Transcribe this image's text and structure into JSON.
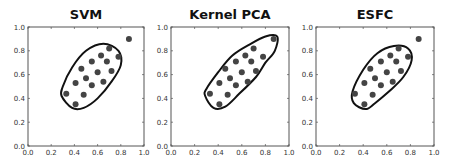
{
  "chart_data": [
    {
      "type": "scatter",
      "title": "SVM",
      "xlabel": "",
      "ylabel": "",
      "xlim": [
        0.0,
        1.0
      ],
      "ylim": [
        0.0,
        1.0
      ],
      "xticks": [
        "0.0",
        "0.2",
        "0.4",
        "0.6",
        "0.8",
        "1.0"
      ],
      "yticks": [
        "0.0",
        "0.2",
        "0.4",
        "0.6",
        "0.8",
        "1.0"
      ],
      "grid": false,
      "points": [
        [
          0.33,
          0.44
        ],
        [
          0.41,
          0.35
        ],
        [
          0.41,
          0.53
        ],
        [
          0.46,
          0.65
        ],
        [
          0.48,
          0.43
        ],
        [
          0.5,
          0.57
        ],
        [
          0.55,
          0.71
        ],
        [
          0.55,
          0.51
        ],
        [
          0.6,
          0.62
        ],
        [
          0.63,
          0.76
        ],
        [
          0.65,
          0.54
        ],
        [
          0.68,
          0.71
        ],
        [
          0.7,
          0.82
        ],
        [
          0.72,
          0.63
        ],
        [
          0.78,
          0.75
        ],
        [
          0.87,
          0.9
        ]
      ],
      "boundary": "closed contour enclosing all points except (0.87,0.90)",
      "boundary_path": [
        [
          0.3,
          0.5
        ],
        [
          0.38,
          0.66
        ],
        [
          0.5,
          0.8
        ],
        [
          0.65,
          0.86
        ],
        [
          0.78,
          0.8
        ],
        [
          0.8,
          0.68
        ],
        [
          0.72,
          0.54
        ],
        [
          0.6,
          0.4
        ],
        [
          0.48,
          0.32
        ],
        [
          0.38,
          0.32
        ],
        [
          0.29,
          0.42
        ]
      ]
    },
    {
      "type": "scatter",
      "title": "Kernel PCA",
      "xlabel": "",
      "ylabel": "",
      "xlim": [
        0.0,
        1.0
      ],
      "ylim": [
        0.0,
        1.0
      ],
      "xticks": [
        "0.0",
        "0.2",
        "0.4",
        "0.6",
        "0.8",
        "1.0"
      ],
      "yticks": [
        "0.0",
        "0.2",
        "0.4",
        "0.6",
        "0.8",
        "1.0"
      ],
      "grid": false,
      "points": [
        [
          0.33,
          0.44
        ],
        [
          0.41,
          0.35
        ],
        [
          0.41,
          0.53
        ],
        [
          0.46,
          0.65
        ],
        [
          0.48,
          0.43
        ],
        [
          0.5,
          0.57
        ],
        [
          0.55,
          0.71
        ],
        [
          0.55,
          0.51
        ],
        [
          0.6,
          0.62
        ],
        [
          0.63,
          0.76
        ],
        [
          0.65,
          0.54
        ],
        [
          0.68,
          0.71
        ],
        [
          0.7,
          0.82
        ],
        [
          0.72,
          0.63
        ],
        [
          0.78,
          0.75
        ],
        [
          0.87,
          0.9
        ]
      ],
      "boundary": "closed elongated contour enclosing all points including (0.87,0.90)",
      "boundary_path": [
        [
          0.3,
          0.48
        ],
        [
          0.4,
          0.62
        ],
        [
          0.52,
          0.76
        ],
        [
          0.66,
          0.85
        ],
        [
          0.8,
          0.92
        ],
        [
          0.9,
          0.92
        ],
        [
          0.88,
          0.8
        ],
        [
          0.8,
          0.7
        ],
        [
          0.72,
          0.58
        ],
        [
          0.58,
          0.44
        ],
        [
          0.46,
          0.33
        ],
        [
          0.36,
          0.32
        ],
        [
          0.29,
          0.42
        ]
      ]
    },
    {
      "type": "scatter",
      "title": "ESFC",
      "xlabel": "",
      "ylabel": "",
      "xlim": [
        0.0,
        1.0
      ],
      "ylim": [
        0.0,
        1.0
      ],
      "xticks": [
        "0.0",
        "0.2",
        "0.4",
        "0.6",
        "0.8",
        "1.0"
      ],
      "yticks": [
        "0.0",
        "0.2",
        "0.4",
        "0.6",
        "0.8",
        "1.0"
      ],
      "grid": false,
      "points": [
        [
          0.33,
          0.44
        ],
        [
          0.41,
          0.35
        ],
        [
          0.41,
          0.53
        ],
        [
          0.46,
          0.65
        ],
        [
          0.48,
          0.43
        ],
        [
          0.5,
          0.57
        ],
        [
          0.55,
          0.71
        ],
        [
          0.55,
          0.51
        ],
        [
          0.6,
          0.62
        ],
        [
          0.63,
          0.76
        ],
        [
          0.65,
          0.54
        ],
        [
          0.68,
          0.71
        ],
        [
          0.7,
          0.82
        ],
        [
          0.72,
          0.63
        ],
        [
          0.78,
          0.75
        ],
        [
          0.87,
          0.9
        ]
      ],
      "boundary": "closed contour enclosing all points except (0.87,0.90)",
      "boundary_path": [
        [
          0.31,
          0.46
        ],
        [
          0.4,
          0.64
        ],
        [
          0.52,
          0.78
        ],
        [
          0.66,
          0.84
        ],
        [
          0.78,
          0.82
        ],
        [
          0.81,
          0.72
        ],
        [
          0.74,
          0.58
        ],
        [
          0.62,
          0.46
        ],
        [
          0.5,
          0.36
        ],
        [
          0.42,
          0.31
        ],
        [
          0.32,
          0.36
        ]
      ]
    }
  ],
  "panels": [
    {
      "title": "SVM"
    },
    {
      "title": "Kernel PCA"
    },
    {
      "title": "ESFC"
    }
  ],
  "ticks": [
    "0.0",
    "0.2",
    "0.4",
    "0.6",
    "0.8",
    "1.0"
  ],
  "colors": {
    "point": "#444444",
    "boundary": "#111111",
    "axis": "#555555"
  }
}
